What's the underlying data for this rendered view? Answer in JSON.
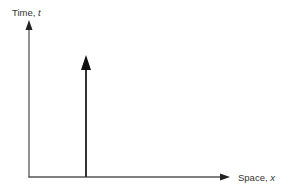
{
  "diagram": {
    "type": "spacetime-diagram",
    "axes": {
      "vertical": {
        "label_text": "Time, ",
        "label_var": "t"
      },
      "horizontal": {
        "label_text": "Space, ",
        "label_var": "x"
      }
    },
    "worldline": {
      "description": "vertical arrow (stationary object)",
      "direction": "up"
    },
    "colors": {
      "axis": "#555555",
      "worldline": "#222222",
      "text": "#333333",
      "background": "#ffffff"
    }
  }
}
